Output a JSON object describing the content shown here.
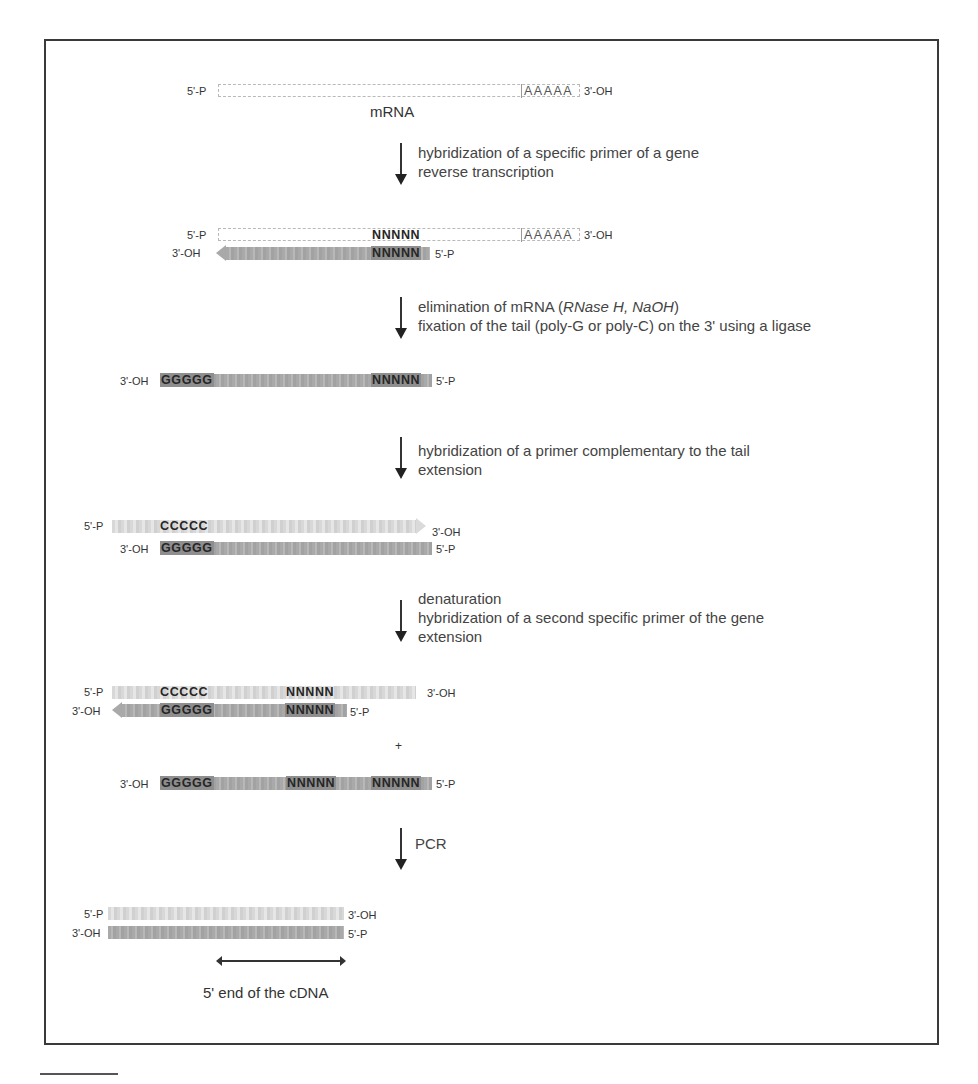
{
  "figure": {
    "title_label": "mRNA",
    "caption": "5' end of the cDNA",
    "plus_sign": "+",
    "ends": {
      "five_p": "5'-P",
      "three_oh": "3'-OH"
    },
    "sequences": {
      "poly_a": "AAAAA",
      "n_primer": "NNNNN",
      "poly_g": "GGGGG",
      "poly_c": "CCCCC"
    },
    "colors": {
      "frame": "#3a3a3a",
      "dark_strand": "#a9a9a9",
      "light_strand": "#dadada",
      "text": "#444444"
    }
  },
  "steps": [
    {
      "lines": [
        "hybridization of a specific primer of a gene",
        "reverse transcription"
      ]
    },
    {
      "lines": [
        "elimination of mRNA (",
        "RNase H, NaOH",
        ")",
        "fixation of the tail (poly-G or poly-C) on the 3' using a ligase"
      ]
    },
    {
      "lines": [
        "hybridization of a primer complementary to the tail",
        "extension"
      ]
    },
    {
      "lines": [
        "denaturation",
        "hybridization of a second specific primer of the gene",
        "extension"
      ]
    },
    {
      "lines": [
        "PCR"
      ]
    }
  ]
}
